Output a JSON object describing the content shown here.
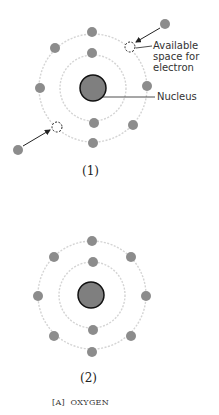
{
  "figure": {
    "label": "[A]",
    "title": "OXYGEN"
  },
  "diagram1": {
    "caption": "(1)",
    "annotation_space": "Available space for electron",
    "annotation_space_lines": [
      "Available",
      "space for",
      "electron"
    ],
    "annotation_nucleus": "Nucleus",
    "center": [
      93,
      88
    ],
    "inner_radius": 33,
    "outer_radius": 54,
    "inner_electrons": 2,
    "outer_electrons": 4,
    "vacancies": 2,
    "incoming_electrons": 2
  },
  "diagram2": {
    "caption": "(2)",
    "center": [
      92,
      295
    ],
    "inner_radius": 33,
    "outer_radius": 54,
    "inner_electrons": 2,
    "outer_electrons": 8
  },
  "colors": {
    "electron": "#8c8c8c",
    "nucleus_fill": "#7f7f7f",
    "nucleus_stroke": "#111111",
    "orbit": "#d4d4d4",
    "arrow": "#222222"
  }
}
